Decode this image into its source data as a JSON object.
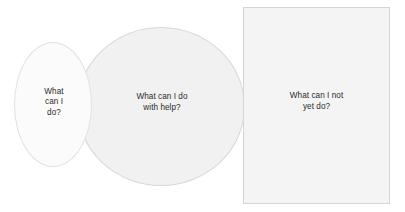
{
  "diagram": {
    "type": "nested-zones",
    "background_color": "#ffffff",
    "text_color": "#2b2b2b",
    "zones": [
      {
        "id": "can-do",
        "shape": "ellipse",
        "label": "What\ncan I\ndo?",
        "fill_color": "#fbfbfb",
        "stroke_color": "#e2e2e2"
      },
      {
        "id": "with-help",
        "shape": "ellipse",
        "label": "What can I do\nwith help?",
        "fill_color": "#f1f1f1",
        "stroke_color": "#d8d8d8"
      },
      {
        "id": "not-yet",
        "shape": "rectangle",
        "label": "What can I not\nyet do?",
        "fill_color": "#f4f4f4",
        "stroke_color": "#d5d5d5"
      }
    ]
  }
}
